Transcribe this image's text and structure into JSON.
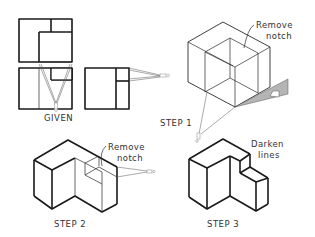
{
  "figure": {
    "panels": [
      {
        "id": "given",
        "label": "GIVEN"
      },
      {
        "id": "step1",
        "label": "STEP  1",
        "annotation_line1": "Remove",
        "annotation_line2": "notch"
      },
      {
        "id": "step2",
        "label": "STEP  2",
        "annotation_line1": "Remove",
        "annotation_line2": "notch"
      },
      {
        "id": "step3",
        "label": "STEP  3",
        "annotation_line1": "Darken",
        "annotation_line2": "lines"
      }
    ],
    "colors": {
      "line": "#1a1a1a",
      "triangle_fill": "#b5b5b5",
      "background": "#ffffff"
    },
    "icons": [
      "divider-icon",
      "triangle-icon"
    ]
  }
}
